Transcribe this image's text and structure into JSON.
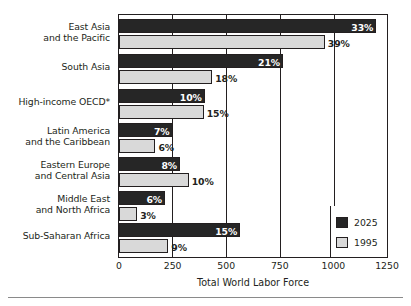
{
  "chart_data": {
    "type": "bar",
    "orientation": "horizontal",
    "title": "",
    "xlabel": "Total World Labor Force",
    "ylabel": "",
    "xlim": [
      0,
      1250
    ],
    "xticks": [
      0,
      250,
      500,
      750,
      1000,
      1250
    ],
    "xtick_labels": [
      "0",
      "250",
      "500",
      "750",
      "1000",
      "1250"
    ],
    "grid": "vertical-gridlines-at-250-500-750-1000",
    "legend_position": "bottom-right",
    "categories": [
      "East Asia and the Pacific",
      "South Asia",
      "High-income OECD*",
      "Latin America and the Caribbean",
      "Eastern Europe and Central Asia",
      "Middle East and North Africa",
      "Sub-Saharan Africa"
    ],
    "category_lines": [
      [
        "East Asia",
        "and the Pacific"
      ],
      [
        "South Asia"
      ],
      [
        "High-income OECD*"
      ],
      [
        "Latin America",
        "and the Caribbean"
      ],
      [
        "Eastern Europe",
        "and Central Asia"
      ],
      [
        "Middle East",
        "and North Africa"
      ],
      [
        "Sub-Saharan Africa"
      ]
    ],
    "series": [
      {
        "name": "2025",
        "color": "#262626",
        "values": [
          1200,
          765,
          400,
          250,
          285,
          215,
          565
        ],
        "data_labels": [
          "33%",
          "21%",
          "10%",
          "7%",
          "8%",
          "6%",
          "15%"
        ],
        "label_placement": [
          "inside",
          "inside",
          "inside",
          "inside",
          "inside",
          "inside",
          "inside"
        ]
      },
      {
        "name": "1995",
        "color": "#d9d9d9",
        "values": [
          960,
          435,
          395,
          170,
          325,
          85,
          230
        ],
        "data_labels": [
          "39%",
          "18%",
          "15%",
          "6%",
          "10%",
          "3%",
          "9%"
        ],
        "label_placement": [
          "outside",
          "outside",
          "outside",
          "outside",
          "outside",
          "outside",
          "outside"
        ]
      }
    ]
  },
  "legend": {
    "entries": [
      {
        "label": "2025",
        "swatch": "dark"
      },
      {
        "label": "1995",
        "swatch": "light"
      }
    ]
  },
  "axis": {
    "title": "Total World Labor Force"
  }
}
